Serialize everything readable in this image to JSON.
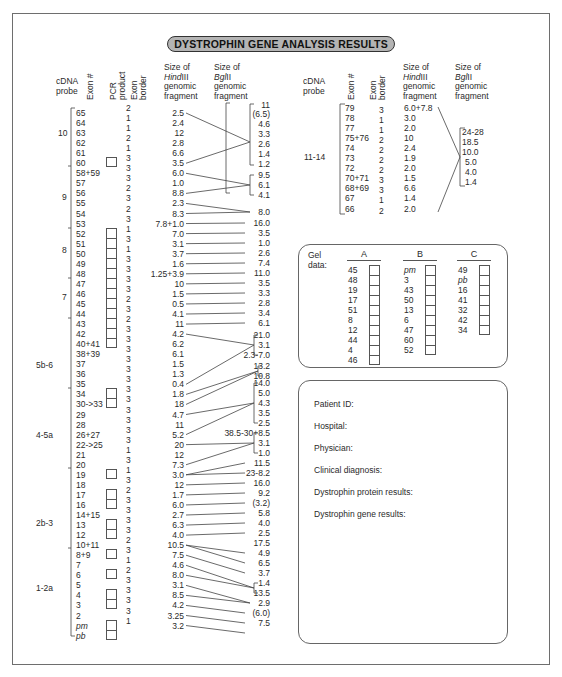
{
  "title": "DYSTROPHIN GENE ANALYSIS RESULTS",
  "headers": {
    "cdna_probe": [
      "cDNA",
      "probe"
    ],
    "exon_num": "Exon #",
    "pcr_product": [
      "PCR",
      "product"
    ],
    "exon_border": [
      "Exon",
      "border"
    ],
    "hindiii": [
      "Size of",
      "HindIII",
      "genomic",
      "fragment"
    ],
    "bglii": [
      "Size of",
      "BglII",
      "genomic",
      "fragment"
    ]
  },
  "left_table": {
    "probes": [
      {
        "label": "10",
        "exons_from": "65",
        "exons_to": "60"
      },
      {
        "label": "9",
        "exons_from": "58+59",
        "exons_to": "53"
      },
      {
        "label": "8",
        "exons_from": "52",
        "exons_to": "48"
      },
      {
        "label": "7",
        "exons_from": "47",
        "exons_to": "44"
      },
      {
        "label": "5b-6",
        "exons_from": "43",
        "exons_to": "35"
      },
      {
        "label": "4-5a",
        "exons_from": "34",
        "exons_to": "21"
      },
      {
        "label": "2b-3",
        "exons_from": "20",
        "exons_to": "12"
      },
      {
        "label": "1-2a",
        "exons_from": "10+11",
        "exons_to": "pb"
      }
    ],
    "exons": [
      "65",
      "64",
      "63",
      "62",
      "61",
      "60",
      "58+59",
      "57",
      "56",
      "55",
      "54",
      "53",
      "52",
      "51",
      "50",
      "49",
      "48",
      "47",
      "46",
      "45",
      "44",
      "43",
      "42",
      "40+41",
      "38+39",
      "37",
      "36",
      "35",
      "34",
      "30->33",
      "29",
      "28",
      "26+27",
      "22->25",
      "21",
      "20",
      "19",
      "18",
      "17",
      "16",
      "14+15",
      "13",
      "12",
      "10+11",
      "8+9",
      "7",
      "6",
      "5",
      "4",
      "3",
      "2",
      "pm",
      "pb"
    ],
    "exon_borders": [
      "2",
      "1",
      "1",
      "2",
      "1",
      "3",
      "3",
      "3",
      "2",
      "3",
      "2",
      "3",
      "1",
      "3",
      "1",
      "3",
      "3",
      "3",
      "3",
      "2",
      "3",
      "2",
      "3",
      "3",
      "3",
      "3",
      "3",
      "3",
      "3",
      "3",
      "3",
      "3",
      "3",
      "3",
      "1",
      "3",
      "1",
      "3",
      "2",
      "3",
      "3",
      "3",
      "3",
      "2",
      "3",
      "1",
      "2",
      "3",
      "3",
      "3",
      "3",
      "1"
    ],
    "hindiii": [
      "2.5",
      "2.4",
      "12",
      "2.8",
      "6.6",
      "3.5",
      "6.0",
      "1.0",
      "8.8",
      "2.3",
      "8.3",
      "7.8+1.0",
      "7.0",
      "3.1",
      "3.7",
      "1.6",
      "1.25+3.9",
      "10",
      "1.5",
      "0.5",
      "4.1",
      "11",
      "4.2",
      "6.2",
      "6.1",
      "1.5",
      "1.3",
      "0.4",
      "1.8",
      "18",
      "4.7",
      "11",
      "5.2",
      "20",
      "12",
      "7.3",
      "3.0",
      "12",
      "1.7",
      "6.0",
      "2.7",
      "6.3",
      "4.0",
      "10.5",
      "7.5",
      "4.6",
      "8.0",
      "3.1",
      "8.5",
      "4.2",
      "3.25",
      "3.2"
    ],
    "bglii": [
      "11",
      "(6.5)",
      "4.6",
      "3.3",
      "2.6",
      "1.4",
      "1.2",
      "9.5",
      "6.1",
      "4.1",
      "8.0",
      "16.0",
      "3.5",
      "1.0",
      "2.6",
      "7.4",
      "11.0",
      "3.5",
      "3.3",
      "2.8",
      "3.4",
      "6.1",
      "21.0",
      "3.1",
      "2.3-7.0",
      "13.2",
      "10.8",
      "14.0",
      "5.0",
      "4.3",
      "3.5",
      "2.5",
      "38.5-30+8.5",
      "3.1",
      "1.0",
      "11.5",
      "23-8.2",
      "16.0",
      "9.2",
      "(3.2)",
      "5.8",
      "4.0",
      "2.5",
      "17.5",
      "4.9",
      "6.5",
      "3.7",
      "1.4",
      "13.5",
      "2.9",
      "(6.0)",
      "7.5"
    ]
  },
  "right_table": {
    "probe": "11-14",
    "exons": [
      "79",
      "78",
      "77",
      "75+76",
      "74",
      "73",
      "72",
      "70+71",
      "68+69",
      "67",
      "66"
    ],
    "exon_borders": [
      "3",
      "1",
      "1",
      "2",
      "2",
      "2",
      "2",
      "3",
      "3",
      "1",
      "2"
    ],
    "hindiii": [
      "6.0+7.8",
      "3.0",
      "2.0",
      "10",
      "2.4",
      "1.9",
      "2.0",
      "1.5",
      "6.6",
      "1.4",
      "2.0"
    ],
    "bglii": [
      "24-28",
      "18.5",
      "10.0",
      "5.0",
      "4.0",
      "1.4"
    ]
  },
  "gel_data": {
    "label": [
      "Gel",
      "data:"
    ],
    "columns": [
      {
        "name": "A",
        "items": [
          "45",
          "48",
          "19",
          "17",
          "51",
          "8",
          "12",
          "44",
          "4",
          "46"
        ]
      },
      {
        "name": "B",
        "items": [
          "pm",
          "3",
          "43",
          "50",
          "13",
          "6",
          "47",
          "60",
          "52"
        ]
      },
      {
        "name": "C",
        "items": [
          "49",
          "pb",
          "16",
          "41",
          "32",
          "42",
          "34"
        ]
      }
    ]
  },
  "patient_form": {
    "fields": [
      "Patient ID:",
      "Hospital:",
      "Physician:",
      "Clinical diagnosis:",
      "Dystrophin protein results:",
      "Dystrophin gene results:"
    ]
  }
}
